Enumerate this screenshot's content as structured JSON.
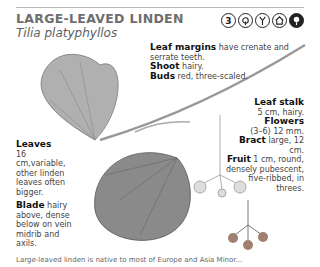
{
  "header": {
    "title": "LARGE-LEAVED LINDEN",
    "latin_name": "Tilia platyphyllos",
    "icons": [
      {
        "name": "number-3-icon",
        "glyph": "3"
      },
      {
        "name": "broadleaf-tree-icon",
        "glyph": ""
      },
      {
        "name": "twig-icon",
        "glyph": ""
      },
      {
        "name": "house-icon",
        "glyph": ""
      },
      {
        "name": "tree-dark-icon",
        "glyph": ""
      }
    ]
  },
  "annotations": {
    "leaf_margins": {
      "label": "Leaf margins",
      "text": " have crenate and serrate teeth."
    },
    "shoot": {
      "label": "Shoot",
      "text": " hairy."
    },
    "buds": {
      "label": "Buds",
      "text": " red, three-scaled."
    },
    "leaf_stalk": {
      "label": "Leaf stalk",
      "text": "5 cm, hairy."
    },
    "flowers": {
      "label": "Flowers",
      "text": "(3–6) 12 mm."
    },
    "bract": {
      "label": "Bract",
      "text": " large, 12 cm."
    },
    "fruit": {
      "label": "Fruit",
      "text": " 1 cm, round, densely pubescent, five-ribbed, in threes."
    },
    "leaves": {
      "label": "Leaves",
      "text": "16 cm,variable, other linden leaves often bigger."
    },
    "blade": {
      "label": "Blade",
      "text": " hairy above, dense below on vein midrib and axils."
    }
  },
  "footer": {
    "text": "Large-leaved linden is native to most of Europe and Asia Minor..."
  },
  "colors": {
    "title": "#6e6e6e",
    "rule": "#b8b8b8",
    "leaf": "#8a8a8a",
    "fruit": "#a08070"
  }
}
